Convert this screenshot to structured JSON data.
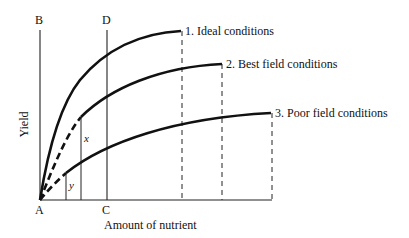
{
  "diagram": {
    "type": "yield-response-curves",
    "axes": {
      "xlabel": "Amount of nutrient",
      "ylabel": "Yield"
    },
    "points": {
      "A": "A",
      "B": "B",
      "C": "C",
      "D": "D"
    },
    "annotations": {
      "x": "x",
      "y": "y"
    },
    "curves": [
      {
        "id": 1,
        "label": "1. Ideal conditions"
      },
      {
        "id": 2,
        "label": "2. Best field conditions"
      },
      {
        "id": 3,
        "label": "3. Poor field conditions"
      }
    ]
  }
}
